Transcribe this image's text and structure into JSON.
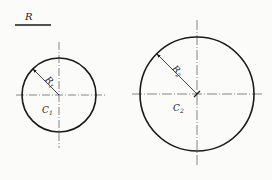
{
  "diagram": {
    "type": "geometry-construction",
    "colors": {
      "stroke": "#1a1a1a",
      "centerline": "#555555",
      "background": "#fbfbfa"
    },
    "reference_length": {
      "label": "R",
      "x1": 15,
      "x2": 51,
      "y": 25
    },
    "circles": [
      {
        "name": "C",
        "name_sub": "1",
        "radius_label": "R",
        "radius_sub": "1",
        "cx": 59,
        "cy": 95,
        "r": 37
      },
      {
        "name": "C",
        "name_sub": "2",
        "radius_label": "R",
        "radius_sub": "2",
        "cx": 197,
        "cy": 94,
        "r": 57
      }
    ]
  }
}
